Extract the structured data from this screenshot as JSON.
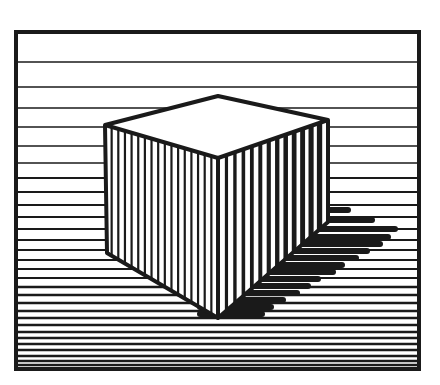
{
  "artwork": {
    "title": "Striped cube optical illusion",
    "colors": {
      "ink": "#1a1a1a",
      "paper": "#ffffff"
    },
    "frame": {
      "x1": 16,
      "y1": 32,
      "x2": 419,
      "y2": 369,
      "stroke": 4
    },
    "background_lines": {
      "ys": [
        62,
        87,
        108,
        127,
        146,
        163,
        178,
        192,
        205,
        217,
        229,
        240,
        250,
        260,
        269,
        278,
        287,
        295,
        303,
        311,
        318,
        325,
        332,
        338,
        344,
        350,
        356,
        361,
        365
      ],
      "widths": [
        1.5,
        1.5,
        1.6,
        1.6,
        1.7,
        1.7,
        1.8,
        1.8,
        1.9,
        1.9,
        2,
        2,
        2.1,
        2.1,
        2.2,
        2.2,
        2.3,
        2.3,
        2.4,
        2.4,
        2.4,
        2.5,
        2.5,
        2.5,
        2.5,
        2.5,
        2.5,
        2.5,
        2.5
      ]
    },
    "cube": {
      "top": [
        [
          218,
          96
        ],
        [
          328,
          120
        ],
        [
          218,
          158
        ],
        [
          105,
          125
        ]
      ],
      "left_face": [
        [
          105,
          125
        ],
        [
          218,
          158
        ],
        [
          218,
          318
        ],
        [
          107,
          253
        ]
      ],
      "right_face": [
        [
          218,
          158
        ],
        [
          328,
          120
        ],
        [
          328,
          222
        ],
        [
          218,
          318
        ]
      ],
      "left_stripe_count": 17,
      "right_stripe_count": 13,
      "outline_width": 4
    },
    "shadow": {
      "polygon": [
        [
          328,
          195
        ],
        [
          395,
          226
        ],
        [
          300,
          300
        ],
        [
          230,
          318
        ],
        [
          328,
          222
        ]
      ],
      "bars": [
        {
          "y": 210,
          "x2": 348
        },
        {
          "y": 220,
          "x2": 372
        },
        {
          "y": 229,
          "x2": 395
        },
        {
          "y": 237,
          "x2": 388
        },
        {
          "y": 244,
          "x2": 380
        },
        {
          "y": 251,
          "x2": 367
        },
        {
          "y": 258,
          "x2": 356
        },
        {
          "y": 265,
          "x2": 342
        },
        {
          "y": 272,
          "x2": 333
        },
        {
          "y": 279,
          "x2": 318
        },
        {
          "y": 286,
          "x2": 308
        },
        {
          "y": 293,
          "x2": 297
        },
        {
          "y": 300,
          "x2": 283
        },
        {
          "y": 307,
          "x2": 271
        },
        {
          "y": 314,
          "x2": 262
        }
      ]
    }
  }
}
